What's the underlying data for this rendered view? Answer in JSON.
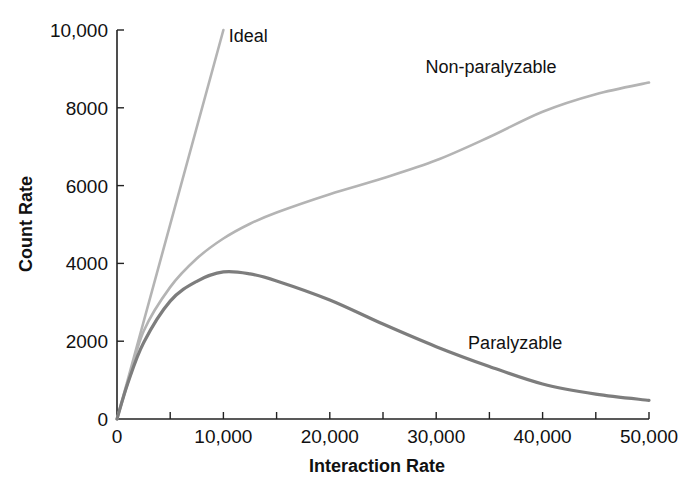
{
  "chart_data": {
    "type": "line",
    "title": "",
    "xlabel": "Interaction Rate",
    "ylabel": "Count Rate",
    "xlim": [
      0,
      50000
    ],
    "ylim": [
      0,
      10000
    ],
    "grid": false,
    "legend_position": "inline labels",
    "x_ticks": [
      0,
      10000,
      20000,
      30000,
      40000,
      50000
    ],
    "x_tick_labels": [
      "0",
      "10,000",
      "20,000",
      "30,000",
      "40,000",
      "50,000"
    ],
    "x_minor_ticks": [
      5000,
      15000,
      25000,
      35000,
      45000
    ],
    "y_ticks": [
      0,
      2000,
      4000,
      6000,
      8000,
      10000
    ],
    "y_tick_labels": [
      "0",
      "2000",
      "4000",
      "6000",
      "8000",
      "10,000"
    ],
    "x": [
      0,
      1000,
      2500,
      5000,
      7500,
      10000,
      12500,
      15000,
      20000,
      25000,
      30000,
      35000,
      40000,
      45000,
      50000
    ],
    "series": [
      {
        "name": "Ideal",
        "color": "#b4b4b4",
        "x": [
          0,
          10000
        ],
        "values": [
          0,
          10000
        ]
      },
      {
        "name": "Non-paralyzable",
        "color": "#b4b4b4",
        "values": [
          0,
          913,
          2256,
          3390,
          4125,
          4640,
          5020,
          5310,
          5780,
          6190,
          6650,
          7250,
          7900,
          8350,
          8650
        ]
      },
      {
        "name": "Paralyzable",
        "color": "#7d7d7d",
        "values": [
          0,
          907,
          1960,
          3030,
          3540,
          3780,
          3730,
          3550,
          3060,
          2440,
          1860,
          1350,
          900,
          640,
          480
        ]
      }
    ],
    "annotations": [
      {
        "text": "Ideal",
        "x": 10500,
        "y": 9700
      },
      {
        "text": "Non-paralyzable",
        "x": 29000,
        "y": 8900
      },
      {
        "text": "Paralyzable",
        "x": 33000,
        "y": 1800
      }
    ]
  }
}
